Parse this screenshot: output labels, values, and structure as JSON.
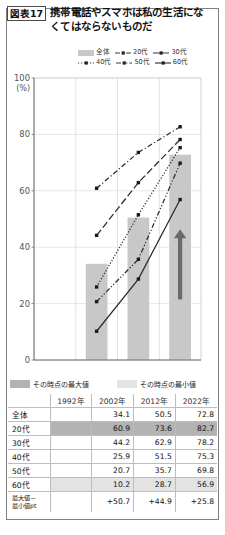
{
  "figure": {
    "number_label": "図表17",
    "title": "携帯電話やスマホは私の生活になくてはならないものだ"
  },
  "legend": {
    "items": [
      {
        "label": "全体",
        "style": "bar",
        "icon": "legend-bar-swatch"
      },
      {
        "label": "20代",
        "style": "dash-dot",
        "icon": "legend-line-dash-dot"
      },
      {
        "label": "30代",
        "style": "long-dash",
        "icon": "legend-line-long-dash"
      },
      {
        "label": "40代",
        "style": "dotted",
        "icon": "legend-line-dotted"
      },
      {
        "label": "50代",
        "style": "dash-dot-dot",
        "icon": "legend-line-dash-dot-dot"
      },
      {
        "label": "60代",
        "style": "solid",
        "icon": "legend-line-solid"
      }
    ]
  },
  "chart_data": {
    "type": "line",
    "title": "携帯電話やスマホは私の生活になくてはならないものだ",
    "xlabel": "",
    "ylabel": "(%)",
    "ylim": [
      0,
      100
    ],
    "yticks": [
      0,
      20,
      40,
      60,
      80,
      100
    ],
    "grid": true,
    "legend_position": "top",
    "categories": [
      "1992年",
      "2002年",
      "2012年",
      "2022年"
    ],
    "x": [
      "1992",
      "2002",
      "2012",
      "2022"
    ],
    "bars": {
      "name": "全体",
      "color": "#c8c8c8",
      "values": [
        null,
        34.1,
        50.5,
        72.8
      ]
    },
    "series": [
      {
        "name": "20代",
        "style": "dash-dot",
        "values": [
          null,
          60.9,
          73.6,
          82.7
        ]
      },
      {
        "name": "30代",
        "style": "long-dash",
        "values": [
          null,
          44.2,
          62.9,
          78.2
        ]
      },
      {
        "name": "40代",
        "style": "dotted",
        "values": [
          null,
          25.9,
          51.5,
          75.3
        ]
      },
      {
        "name": "50代",
        "style": "dash-dot-dot",
        "values": [
          null,
          20.7,
          35.7,
          69.8
        ]
      },
      {
        "name": "60代",
        "style": "solid",
        "values": [
          null,
          10.2,
          28.7,
          56.9
        ]
      }
    ],
    "annotations": [
      {
        "kind": "up-arrow",
        "at": "2022年",
        "meaning": "increase"
      }
    ]
  },
  "key": {
    "max_label": "その時点の最大値",
    "min_label": "その時点の最小値",
    "max_color": "#b3b3b3",
    "min_color": "#e3e3e3"
  },
  "table": {
    "columns": [
      "",
      "1992年",
      "2002年",
      "2012年",
      "2022年"
    ],
    "rows": [
      {
        "label": "全体",
        "highlight": "none",
        "values": [
          "",
          "34.1",
          "50.5",
          "72.8"
        ]
      },
      {
        "label": "20代",
        "highlight": "max",
        "values": [
          "",
          "60.9",
          "73.6",
          "82.7"
        ]
      },
      {
        "label": "30代",
        "highlight": "none",
        "values": [
          "",
          "44.2",
          "62.9",
          "78.2"
        ]
      },
      {
        "label": "40代",
        "highlight": "none",
        "values": [
          "",
          "25.9",
          "51.5",
          "75.3"
        ]
      },
      {
        "label": "50代",
        "highlight": "none",
        "values": [
          "",
          "20.7",
          "35.7",
          "69.8"
        ]
      },
      {
        "label": "60代",
        "highlight": "min",
        "values": [
          "",
          "10.2",
          "28.7",
          "56.9"
        ]
      },
      {
        "label": "最大値－\n最小値pt",
        "highlight": "none",
        "values": [
          "",
          "+50.7",
          "+44.9",
          "+25.8"
        ]
      }
    ]
  }
}
